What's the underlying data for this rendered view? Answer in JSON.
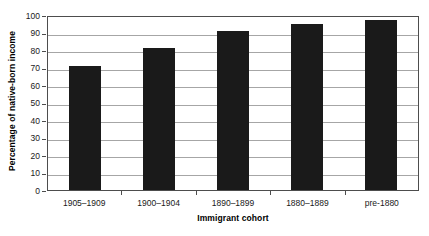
{
  "chart_data": {
    "type": "bar",
    "title": "",
    "subtitle": "",
    "xlabel": "Immigrant cohort",
    "ylabel": "Percentage of native-born income",
    "categories": [
      "1905–1909",
      "1900–1904",
      "1890–1899",
      "1880–1889",
      "pre-1880"
    ],
    "values": [
      71,
      81,
      91,
      95,
      97
    ],
    "series": [
      {
        "name": "Percentage of native-born income",
        "values": [
          71,
          81,
          91,
          95,
          97
        ]
      }
    ],
    "ylim": [
      0,
      100
    ],
    "ytick_step": 10,
    "yticks": [
      100,
      90,
      80,
      70,
      60,
      50,
      40,
      30,
      20,
      10,
      0
    ],
    "grid": "horizontal",
    "legend": "none",
    "bar_color": "#1a1a1a",
    "gridline_color": "#a6a6a6",
    "axis_color": "#4d4d4d",
    "background_color": "#ffffff"
  }
}
